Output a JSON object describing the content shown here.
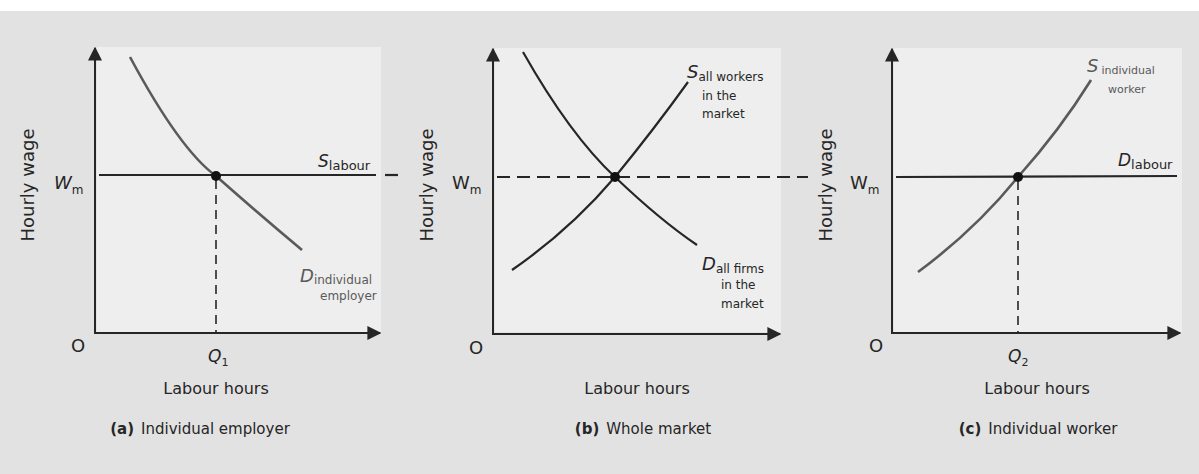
{
  "figure": {
    "background_color": "#e2e2e2",
    "plot_area_color": "#eeeeee",
    "line_color": "#262626",
    "grey_curve_color": "#5a5a5a"
  },
  "panels": [
    {
      "id": "a",
      "caption_letter": "(a)",
      "caption_text": "Individual employer",
      "ylabel": "Hourly wage",
      "xlabel": "Labour hours",
      "origin": "O",
      "wage_label": "W",
      "wage_sub": "m",
      "q_label": "Q",
      "q_sub": "1",
      "curve1": {
        "main": "S",
        "sub": "labour",
        "sub2": ""
      },
      "curve2": {
        "main": "D",
        "sub": "individual",
        "sub2": "employer"
      }
    },
    {
      "id": "b",
      "caption_letter": "(b)",
      "caption_text": "Whole market",
      "ylabel": "Hourly wage",
      "xlabel": "Labour hours",
      "origin": "O",
      "wage_label": "W",
      "wage_sub": "m",
      "curve1": {
        "main": "S",
        "sub": "all workers",
        "sub2": "in the",
        "sub3": "market"
      },
      "curve2": {
        "main": "D",
        "sub": "all firms",
        "sub2": "in the",
        "sub3": "market"
      }
    },
    {
      "id": "c",
      "caption_letter": "(c)",
      "caption_text": "Individual worker",
      "ylabel": "Hourly wage",
      "xlabel": "Labour hours",
      "origin": "O",
      "wage_label": "W",
      "wage_sub": "m",
      "q_label": "Q",
      "q_sub": "2",
      "curve1": {
        "main": "S",
        "sub": "individual",
        "sub2": "worker"
      },
      "curve2": {
        "main": "D",
        "sub": "labour",
        "sub2": ""
      }
    }
  ]
}
